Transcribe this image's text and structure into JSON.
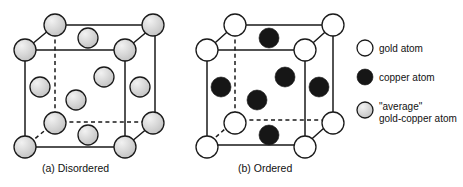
{
  "figure": {
    "background_color": "#ffffff",
    "line_color": "#1a1a1a"
  },
  "panels": [
    {
      "id": "panel-a",
      "caption": "(a) Disordered",
      "caption_x": 42,
      "caption_y": 172,
      "cube": {
        "front_left_x": 25,
        "front_top_y": 50,
        "front_size": 100,
        "depth_dx": 30,
        "depth_dy": -25
      },
      "atoms": [
        {
          "name": "corner-front-top-left",
          "cx": 25,
          "cy": 50,
          "r": 11,
          "kind": "average"
        },
        {
          "name": "corner-front-top-right",
          "cx": 125,
          "cy": 50,
          "r": 11,
          "kind": "average"
        },
        {
          "name": "corner-front-bottom-left",
          "cx": 25,
          "cy": 147,
          "r": 11,
          "kind": "average"
        },
        {
          "name": "corner-front-bottom-right",
          "cx": 125,
          "cy": 147,
          "r": 11,
          "kind": "average"
        },
        {
          "name": "corner-back-top-left",
          "cx": 55,
          "cy": 25,
          "r": 11,
          "kind": "average"
        },
        {
          "name": "corner-back-top-right",
          "cx": 153,
          "cy": 25,
          "r": 11,
          "kind": "average"
        },
        {
          "name": "corner-back-bottom-left",
          "cx": 55,
          "cy": 123,
          "r": 11,
          "kind": "average"
        },
        {
          "name": "corner-back-bottom-right",
          "cx": 153,
          "cy": 123,
          "r": 11,
          "kind": "average"
        },
        {
          "name": "face-center-top",
          "cx": 88,
          "cy": 38,
          "r": 10,
          "kind": "average"
        },
        {
          "name": "face-center-bottom",
          "cx": 88,
          "cy": 135,
          "r": 10,
          "kind": "average"
        },
        {
          "name": "face-center-left",
          "cx": 40,
          "cy": 87,
          "r": 10,
          "kind": "average"
        },
        {
          "name": "face-center-right",
          "cx": 140,
          "cy": 87,
          "r": 10,
          "kind": "average"
        },
        {
          "name": "face-center-front",
          "cx": 76,
          "cy": 100,
          "r": 10,
          "kind": "average"
        },
        {
          "name": "face-center-back",
          "cx": 104,
          "cy": 77,
          "r": 10,
          "kind": "average"
        }
      ]
    },
    {
      "id": "panel-b",
      "caption": "(b) Ordered",
      "caption_x": 238,
      "caption_y": 172,
      "cube": {
        "front_left_x": 207,
        "front_top_y": 50,
        "front_size": 98,
        "depth_dx": 28,
        "depth_dy": -25
      },
      "atoms": [
        {
          "name": "corner-front-top-left",
          "cx": 207,
          "cy": 50,
          "r": 11,
          "kind": "gold"
        },
        {
          "name": "corner-front-top-right",
          "cx": 305,
          "cy": 50,
          "r": 11,
          "kind": "gold"
        },
        {
          "name": "corner-front-bottom-left",
          "cx": 207,
          "cy": 147,
          "r": 11,
          "kind": "gold"
        },
        {
          "name": "corner-front-bottom-right",
          "cx": 305,
          "cy": 147,
          "r": 11,
          "kind": "gold"
        },
        {
          "name": "corner-back-top-left",
          "cx": 235,
          "cy": 25,
          "r": 11,
          "kind": "gold"
        },
        {
          "name": "corner-back-top-right",
          "cx": 333,
          "cy": 25,
          "r": 11,
          "kind": "gold"
        },
        {
          "name": "corner-back-bottom-left",
          "cx": 235,
          "cy": 123,
          "r": 11,
          "kind": "gold"
        },
        {
          "name": "corner-back-bottom-right",
          "cx": 333,
          "cy": 123,
          "r": 11,
          "kind": "gold"
        },
        {
          "name": "face-center-top",
          "cx": 269,
          "cy": 38,
          "r": 10,
          "kind": "copper"
        },
        {
          "name": "face-center-bottom",
          "cx": 269,
          "cy": 135,
          "r": 10,
          "kind": "copper"
        },
        {
          "name": "face-center-left",
          "cx": 221,
          "cy": 87,
          "r": 10,
          "kind": "copper"
        },
        {
          "name": "face-center-right",
          "cx": 319,
          "cy": 87,
          "r": 10,
          "kind": "copper"
        },
        {
          "name": "face-center-front",
          "cx": 257,
          "cy": 100,
          "r": 10,
          "kind": "copper"
        },
        {
          "name": "face-center-back",
          "cx": 285,
          "cy": 77,
          "r": 10,
          "kind": "copper"
        }
      ]
    }
  ],
  "legend": {
    "items": [
      {
        "id": "legend-gold",
        "swatch_kind": "gold",
        "swatch_cx": 365,
        "swatch_cy": 48,
        "swatch_r": 8,
        "lines": [
          "gold atom"
        ],
        "text_x": 379,
        "text_y": 52
      },
      {
        "id": "legend-copper",
        "swatch_kind": "copper",
        "swatch_cx": 365,
        "swatch_cy": 77,
        "swatch_r": 8,
        "lines": [
          "copper atom"
        ],
        "text_x": 379,
        "text_y": 81
      },
      {
        "id": "legend-average",
        "swatch_kind": "average",
        "swatch_cx": 365,
        "swatch_cy": 110,
        "swatch_r": 8,
        "lines": [
          "\"average\"",
          "gold-copper atom"
        ],
        "text_x": 379,
        "text_y": 110
      }
    ]
  },
  "colors": {
    "gold_fill": "#ffffff",
    "copper_fill": "#161616",
    "average_fill_light": "#eeeeee",
    "average_fill_dark": "#c9c9c9",
    "stroke": "#1a1a1a"
  }
}
